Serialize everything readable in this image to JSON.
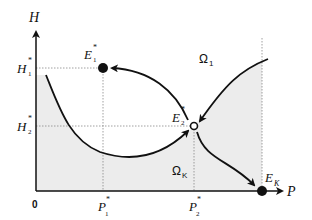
{
  "diagram": {
    "axes": {
      "y_label": "H",
      "x_label": "P",
      "origin_label": "0"
    },
    "y_ticks": [
      {
        "base": "H",
        "sup": "*",
        "sub": "1"
      },
      {
        "base": "H",
        "sup": "*",
        "sub": "2"
      }
    ],
    "x_ticks": [
      {
        "base": "P",
        "sup": "*",
        "sub": "1"
      },
      {
        "base": "P",
        "sup": "*",
        "sub": "2"
      }
    ],
    "equilibria": [
      {
        "base": "E",
        "sup": "*",
        "sub": "1",
        "type": "stable",
        "marker": "filled-circle"
      },
      {
        "base": "E",
        "sup": "*",
        "sub": "2",
        "type": "saddle",
        "marker": "open-circle"
      },
      {
        "base": "E",
        "sup": "",
        "sub": "K",
        "type": "stable",
        "marker": "filled-circle"
      }
    ],
    "regions": [
      {
        "label": "Ω",
        "sub": "1",
        "shading": "white"
      },
      {
        "label": "Ω",
        "sub": "K",
        "shading": "grey"
      }
    ],
    "colors": {
      "stroke": "#111111",
      "shaded_region": "#ececec",
      "guide_lines": "#888888"
    }
  }
}
